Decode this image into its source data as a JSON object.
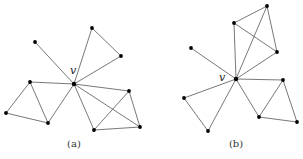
{
  "figures": [
    {
      "id": "a",
      "caption": "(a)",
      "vertex_label": "v",
      "label_pos": [
        70,
        74
      ],
      "caption_pos": [
        74,
        147
      ],
      "nodes": [
        [
          74,
          84
        ],
        [
          35,
          42
        ],
        [
          92,
          28
        ],
        [
          121,
          56
        ],
        [
          30,
          82
        ],
        [
          6,
          113
        ],
        [
          48,
          123
        ],
        [
          129,
          91
        ],
        [
          140,
          127
        ],
        [
          94,
          130
        ]
      ],
      "edges": [
        [
          0,
          1
        ],
        [
          0,
          2
        ],
        [
          2,
          3
        ],
        [
          3,
          0
        ],
        [
          0,
          4
        ],
        [
          4,
          5
        ],
        [
          5,
          6
        ],
        [
          6,
          0
        ],
        [
          4,
          6
        ],
        [
          0,
          7
        ],
        [
          0,
          8
        ],
        [
          0,
          9
        ],
        [
          7,
          8
        ],
        [
          8,
          9
        ],
        [
          9,
          7
        ]
      ]
    },
    {
      "id": "b",
      "caption": "(b)",
      "vertex_label": "v",
      "label_pos": [
        219,
        81
      ],
      "caption_pos": [
        236,
        147
      ],
      "nodes": [
        [
          236,
          79
        ],
        [
          191,
          48
        ],
        [
          234,
          23
        ],
        [
          267,
          6
        ],
        [
          277,
          52
        ],
        [
          184,
          98
        ],
        [
          208,
          131
        ],
        [
          283,
          80
        ],
        [
          259,
          117
        ],
        [
          297,
          122
        ]
      ],
      "edges": [
        [
          0,
          1
        ],
        [
          0,
          2
        ],
        [
          0,
          3
        ],
        [
          0,
          4
        ],
        [
          2,
          3
        ],
        [
          3,
          4
        ],
        [
          2,
          4
        ],
        [
          0,
          5
        ],
        [
          5,
          6
        ],
        [
          6,
          0
        ],
        [
          0,
          7
        ],
        [
          0,
          8
        ],
        [
          7,
          8
        ],
        [
          7,
          9
        ],
        [
          8,
          9
        ]
      ]
    }
  ]
}
